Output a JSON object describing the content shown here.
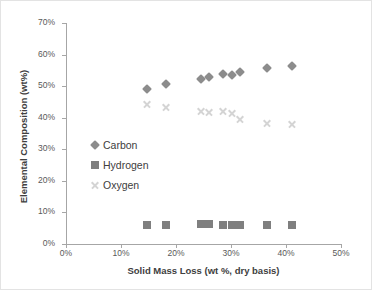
{
  "chart_data": {
    "type": "scatter",
    "title": "",
    "xlabel": "Solid Mass Loss (wt %, dry basis)",
    "ylabel": "Elemental Composition (wt%)",
    "xlim": [
      0,
      50
    ],
    "ylim": [
      0,
      70
    ],
    "xticks": [
      0,
      10,
      20,
      30,
      40,
      50
    ],
    "xtick_labels": [
      "0%",
      "10%",
      "20%",
      "30%",
      "40%",
      "50%"
    ],
    "yticks": [
      0,
      10,
      20,
      30,
      40,
      50,
      60,
      70
    ],
    "ytick_labels": [
      "0%",
      "10%",
      "20%",
      "30%",
      "40%",
      "50%",
      "60%",
      "70%"
    ],
    "grid": false,
    "legend_position": "inside-left",
    "series": [
      {
        "name": "Carbon",
        "marker": "diamond",
        "color": "#8c8c8c",
        "points": [
          [
            14.8,
            49.0
          ],
          [
            18.2,
            50.7
          ],
          [
            24.5,
            52.3
          ],
          [
            26.0,
            53.0
          ],
          [
            28.6,
            53.8
          ],
          [
            30.2,
            53.4
          ],
          [
            31.6,
            54.6
          ],
          [
            36.5,
            55.8
          ],
          [
            41.0,
            56.4
          ]
        ]
      },
      {
        "name": "Hydrogen",
        "marker": "square",
        "color": "#7f7f7f",
        "points": [
          [
            14.8,
            6.1
          ],
          [
            18.2,
            6.1
          ],
          [
            24.5,
            6.2
          ],
          [
            26.0,
            6.2
          ],
          [
            28.6,
            6.1
          ],
          [
            30.2,
            6.1
          ],
          [
            31.6,
            6.1
          ],
          [
            36.5,
            6.0
          ],
          [
            41.0,
            6.0
          ]
        ]
      },
      {
        "name": "Oxygen",
        "marker": "x",
        "color": "#d4d4d4",
        "points": [
          [
            14.8,
            44.5
          ],
          [
            18.2,
            43.4
          ],
          [
            24.5,
            42.0
          ],
          [
            26.0,
            41.8
          ],
          [
            28.6,
            42.0
          ],
          [
            30.2,
            41.4
          ],
          [
            31.6,
            39.5
          ],
          [
            36.5,
            38.3
          ],
          [
            41.0,
            38.0
          ]
        ]
      }
    ]
  },
  "legend": {
    "items": [
      {
        "label": "Carbon",
        "marker": "diamond"
      },
      {
        "label": "Hydrogen",
        "marker": "square"
      },
      {
        "label": "Oxygen",
        "marker": "x"
      }
    ]
  }
}
